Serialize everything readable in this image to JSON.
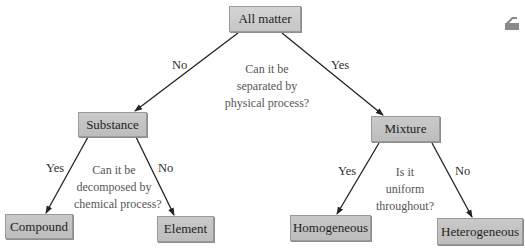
{
  "diagram": {
    "type": "decision-tree",
    "colors": {
      "node_fill": "#c4c4c4",
      "node_border": "#9a9a9a",
      "edge": "#222222",
      "question_text": "#555555",
      "branch_text": "#2f2f2f"
    },
    "nodes": {
      "root": {
        "label": "All matter"
      },
      "substance": {
        "label": "Substance"
      },
      "mixture": {
        "label": "Mixture"
      },
      "compound": {
        "label": "Compound"
      },
      "element": {
        "label": "Element"
      },
      "homogeneous": {
        "label": "Homogeneous"
      },
      "heterogeneous": {
        "label": "Heterogeneous"
      }
    },
    "questions": {
      "root": [
        "Can it be",
        "separated by",
        "physical process?"
      ],
      "substance": [
        "Can it be",
        "decomposed by",
        "chemical process?"
      ],
      "mixture": [
        "Is it",
        "uniform",
        "throughout?"
      ]
    },
    "edges": [
      {
        "from": "root",
        "to": "substance",
        "label": "No"
      },
      {
        "from": "root",
        "to": "mixture",
        "label": "Yes"
      },
      {
        "from": "substance",
        "to": "compound",
        "label": "Yes"
      },
      {
        "from": "substance",
        "to": "element",
        "label": "No"
      },
      {
        "from": "mixture",
        "to": "homogeneous",
        "label": "Yes"
      },
      {
        "from": "mixture",
        "to": "heterogeneous",
        "label": "No"
      }
    ],
    "corner_icon": "page-corner-icon"
  }
}
